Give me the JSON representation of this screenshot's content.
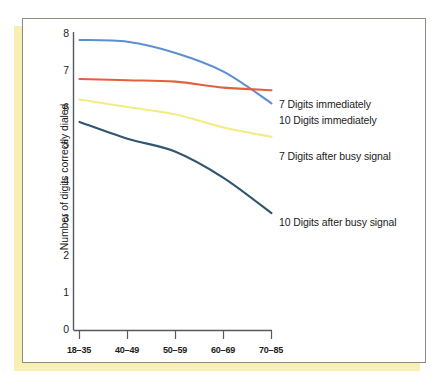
{
  "figure": {
    "frame_color": "#8c8c80",
    "shadow_color": "#f7efb4",
    "background": "#ffffff"
  },
  "chart_data": {
    "type": "line",
    "title": "",
    "xlabel": "",
    "ylabel": "Number of digits correctly dialed",
    "categories": [
      "18–35",
      "40–49",
      "50–59",
      "60–69",
      "70–85"
    ],
    "ylim": [
      0,
      8
    ],
    "yticks": [
      "0",
      "1",
      "2",
      "3",
      "4",
      "5",
      "6",
      "7",
      "8"
    ],
    "grid": false,
    "legend_position": "right-inline",
    "series": [
      {
        "name": "10 Digits immediately",
        "color": "#5b8fd0",
        "values": [
          7.8,
          7.75,
          7.45,
          6.95,
          6.1
        ]
      },
      {
        "name": "7 Digits immediately",
        "color": "#e2603f",
        "values": [
          6.75,
          6.72,
          6.68,
          6.52,
          6.45
        ]
      },
      {
        "name": "7 Digits after busy signal",
        "color": "#f2ec82",
        "values": [
          6.2,
          6.0,
          5.8,
          5.45,
          5.2
        ]
      },
      {
        "name": "10 Digits after busy signal",
        "color": "#31566e",
        "values": [
          5.6,
          5.15,
          4.8,
          4.1,
          3.15
        ]
      }
    ]
  },
  "labels": {
    "series_1": "7 Digits immediately",
    "series_2": "10 Digits immediately",
    "series_3": "7 Digits after busy signal",
    "series_4": "10 Digits after busy signal"
  }
}
